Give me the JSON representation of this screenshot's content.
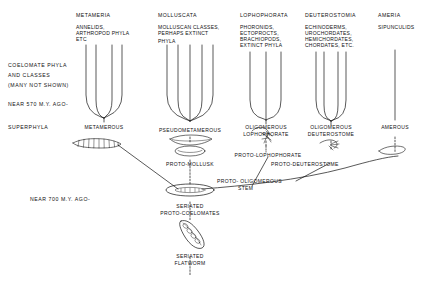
{
  "figure": {
    "type": "cladogram-diagram"
  },
  "side_labels": {
    "coelomate_line1": "COELOMATE PHYLA",
    "coelomate_line2": "AND CLASSES",
    "coelomate_line3": "(MANY NOT SHOWN)",
    "time_570": "NEAR 570 M.Y. AGO-",
    "superphyla": "SUPERPHYLA",
    "time_700": "NEAR 700 M.Y. AGO-"
  },
  "columns": [
    {
      "id": "metameria",
      "heading": "METAMERIA",
      "members": [
        "ANNELIDS,",
        "ARTHROPOD PHYLA",
        "ETC"
      ],
      "node_label": "METAMEROUS",
      "branch_count": 4
    },
    {
      "id": "molluscata",
      "heading": "MOLLUSCATA",
      "members": [
        "MOLLUSCAN CLASSES,",
        "PERHAPS EXTINCT",
        "PHYLA"
      ],
      "node_label": "PSEUDOMETAMEROUS",
      "branch_count": 5
    },
    {
      "id": "lophophorata",
      "heading": "LOPHOPHORATA",
      "members": [
        "PHORONIDS,",
        "ECTOPROCTS,",
        "BRACHIOPODS,",
        "EXTINCT PHYLA"
      ],
      "node_label_line1": "OLIGOMEROUS",
      "node_label_line2": "LOPHOPHORATE",
      "branch_count": 3
    },
    {
      "id": "deuterostomia",
      "heading": "DEUTEROSTOMIA",
      "members": [
        "ECHINODERMS,",
        "UROCHORDATES,",
        "HEMICHORDATES,",
        "CHORDATES, ETC."
      ],
      "node_label_line1": "OLIGOMEROUS",
      "node_label_line2": "DEUTEROSTOME",
      "branch_count": 4
    },
    {
      "id": "ameria",
      "heading": "AMERIA",
      "members": [
        "SIPUNCULIDS"
      ],
      "node_label": "AMEROUS",
      "branch_count": 1
    }
  ],
  "ancestor_nodes": {
    "proto_mollusk": "PROTO-MOLLUSK",
    "proto_lophophorate": "PROTO-LOPHOPHORATE",
    "proto_deuterostome": "PROTO-DEUTEROSTOME",
    "proto_oligomerous_line1": "PROTO- OLIGOMEROUS",
    "proto_oligomerous_line2": "STEM",
    "seriated_protocoelomates_line1": "SERIATED",
    "seriated_protocoelomates_line2": "PROTO-COELOMATES",
    "seriated_flatworm_line1": "SERIATED",
    "seriated_flatworm_line2": "FLATWORM"
  },
  "colors": {
    "ink": "#111111",
    "background": "#ffffff"
  }
}
